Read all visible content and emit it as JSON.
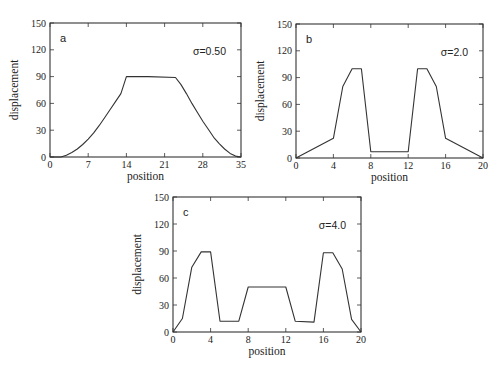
{
  "chart_data": [
    {
      "type": "line",
      "panel_label": "a",
      "annotation": "σ=0.50",
      "xlabel": "position",
      "ylabel": "displacement",
      "xlim": [
        0,
        35
      ],
      "ylim": [
        0,
        150
      ],
      "xticks": [
        0,
        7,
        14,
        21,
        28,
        35
      ],
      "yticks": [
        0,
        30,
        60,
        90,
        120,
        150
      ],
      "grid": false,
      "box": {
        "left": 50,
        "top": 23,
        "right": 241,
        "bottom": 157
      },
      "x": [
        0,
        2,
        3,
        4,
        5,
        6,
        7,
        8,
        9,
        10,
        11,
        12,
        13,
        14,
        18,
        23,
        24,
        25,
        26,
        27,
        28,
        29,
        30,
        31,
        32,
        33,
        34,
        35
      ],
      "y": [
        0,
        0,
        2,
        5,
        9,
        14,
        20,
        27,
        35,
        44,
        53,
        62,
        71,
        90,
        90,
        89,
        81,
        71,
        60,
        50,
        40,
        31,
        22,
        15,
        9,
        4,
        1,
        0
      ]
    },
    {
      "type": "line",
      "panel_label": "b",
      "annotation": "σ=2.0",
      "xlabel": "position",
      "ylabel": "displacement",
      "xlim": [
        0,
        20
      ],
      "ylim": [
        0,
        150
      ],
      "xticks": [
        0,
        4,
        8,
        12,
        16,
        20
      ],
      "yticks": [
        0,
        30,
        60,
        90,
        120,
        150
      ],
      "grid": false,
      "box": {
        "left": 296,
        "top": 24,
        "right": 483,
        "bottom": 158
      },
      "x": [
        0,
        4,
        5,
        6,
        7,
        8,
        12,
        13,
        14,
        15,
        16,
        20
      ],
      "y": [
        0,
        22,
        80,
        100,
        100,
        7,
        7,
        100,
        100,
        80,
        22,
        0
      ]
    },
    {
      "type": "line",
      "panel_label": "c",
      "annotation": "σ=4.0",
      "xlabel": "position",
      "ylabel": "displacement",
      "xlim": [
        0,
        20
      ],
      "ylim": [
        0,
        150
      ],
      "xticks": [
        0,
        4,
        8,
        12,
        16,
        20
      ],
      "yticks": [
        0,
        30,
        60,
        90,
        120,
        150
      ],
      "grid": false,
      "box": {
        "left": 173,
        "top": 197,
        "right": 361,
        "bottom": 332
      },
      "x": [
        0,
        1,
        2,
        3,
        4,
        5,
        7,
        8,
        12,
        13,
        15,
        16,
        17,
        18,
        19,
        20
      ],
      "y": [
        0,
        15,
        72,
        89,
        89,
        12,
        12,
        50,
        50,
        12,
        11,
        88,
        88,
        70,
        14,
        0
      ]
    }
  ]
}
